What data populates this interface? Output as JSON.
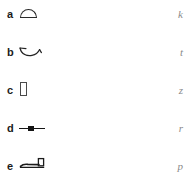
{
  "figure": {
    "background_color": "#ffffff",
    "label_color": "#1b1b1b",
    "glyph_color": "#1b1b1b",
    "side_letter_color": "#8a8a8a",
    "rows": [
      {
        "label": "a",
        "glyph_name": "dome-outline-glyph",
        "side_letter": "k"
      },
      {
        "label": "b",
        "glyph_name": "bowl-hook-glyph",
        "side_letter": "t"
      },
      {
        "label": "c",
        "glyph_name": "upright-rectangle-glyph",
        "side_letter": "z"
      },
      {
        "label": "d",
        "glyph_name": "bar-with-node-glyph",
        "side_letter": "r"
      },
      {
        "label": "e",
        "glyph_name": "line-with-box-glyph",
        "side_letter": "p"
      }
    ]
  }
}
